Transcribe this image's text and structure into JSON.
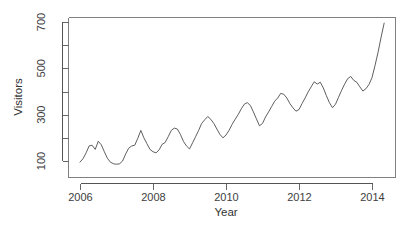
{
  "chart_data": {
    "type": "line",
    "title": "",
    "xlabel": "Year",
    "ylabel": "Visitors",
    "xlim": [
      2006.0,
      2014.5
    ],
    "ylim": [
      78,
      700
    ],
    "grid": false,
    "legend": null,
    "x_tick_labels": [
      "2006",
      "2008",
      "2010",
      "2012",
      "2014"
    ],
    "x_tick_values": [
      2006,
      2008,
      2010,
      2012,
      2014
    ],
    "y_tick_labels": [
      "100",
      "300",
      "500",
      "700"
    ],
    "y_tick_values": [
      100,
      300,
      500,
      700
    ],
    "y_minor_ticks": [
      200,
      400,
      600
    ],
    "series": [
      {
        "name": "Visitors",
        "color": "#4d4d4d",
        "x": [
          2006.0,
          2006.083,
          2006.167,
          2006.25,
          2006.333,
          2006.417,
          2006.5,
          2006.583,
          2006.667,
          2006.75,
          2006.833,
          2006.917,
          2007.0,
          2007.083,
          2007.167,
          2007.25,
          2007.333,
          2007.417,
          2007.5,
          2007.583,
          2007.667,
          2007.75,
          2007.833,
          2007.917,
          2008.0,
          2008.083,
          2008.167,
          2008.25,
          2008.333,
          2008.417,
          2008.5,
          2008.583,
          2008.667,
          2008.75,
          2008.833,
          2008.917,
          2009.0,
          2009.083,
          2009.167,
          2009.25,
          2009.333,
          2009.417,
          2009.5,
          2009.583,
          2009.667,
          2009.75,
          2009.833,
          2009.917,
          2010.0,
          2010.083,
          2010.167,
          2010.25,
          2010.333,
          2010.417,
          2010.5,
          2010.583,
          2010.667,
          2010.75,
          2010.833,
          2010.917,
          2011.0,
          2011.083,
          2011.167,
          2011.25,
          2011.333,
          2011.417,
          2011.5,
          2011.583,
          2011.667,
          2011.75,
          2011.833,
          2011.917,
          2012.0,
          2012.083,
          2012.167,
          2012.25,
          2012.333,
          2012.417,
          2012.5,
          2012.583,
          2012.667,
          2012.75,
          2012.833,
          2012.917,
          2013.0,
          2013.083,
          2013.167,
          2013.25,
          2013.333,
          2013.417,
          2013.5,
          2013.583,
          2013.667,
          2013.75,
          2013.833,
          2013.917,
          2014.0,
          2014.083,
          2014.167,
          2014.25,
          2014.333
        ],
        "values": [
          95,
          110,
          135,
          165,
          168,
          150,
          185,
          170,
          140,
          112,
          95,
          88,
          86,
          88,
          100,
          130,
          155,
          165,
          168,
          198,
          232,
          200,
          175,
          150,
          140,
          135,
          148,
          172,
          180,
          205,
          232,
          242,
          238,
          215,
          185,
          165,
          152,
          178,
          205,
          232,
          262,
          278,
          292,
          280,
          262,
          238,
          215,
          200,
          212,
          232,
          258,
          280,
          300,
          325,
          345,
          352,
          340,
          312,
          282,
          252,
          262,
          290,
          312,
          335,
          358,
          372,
          392,
          388,
          372,
          348,
          330,
          315,
          322,
          348,
          372,
          398,
          420,
          442,
          432,
          440,
          415,
          382,
          352,
          330,
          345,
          375,
          405,
          432,
          455,
          465,
          448,
          440,
          420,
          402,
          412,
          430,
          460,
          512,
          570,
          635,
          695
        ]
      }
    ]
  },
  "axis_titles": {
    "x": "Year",
    "y": "Visitors"
  }
}
